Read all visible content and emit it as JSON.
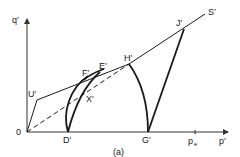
{
  "diagram": {
    "caption": "(a)",
    "axes": {
      "y_label": "q′",
      "x_label": "p′",
      "origin_label": "0",
      "x_tick_label": "p",
      "x_tick_sub": "e",
      "x_tick_prime": "′"
    },
    "points": {
      "U": "U′",
      "F": "F′",
      "E": "E′",
      "X": "X′",
      "H": "H′",
      "J": "J′",
      "S": "S′",
      "D": "D′",
      "G": "G′"
    },
    "colors": {
      "line": "#1a1a1a",
      "axis": "#333333"
    }
  }
}
